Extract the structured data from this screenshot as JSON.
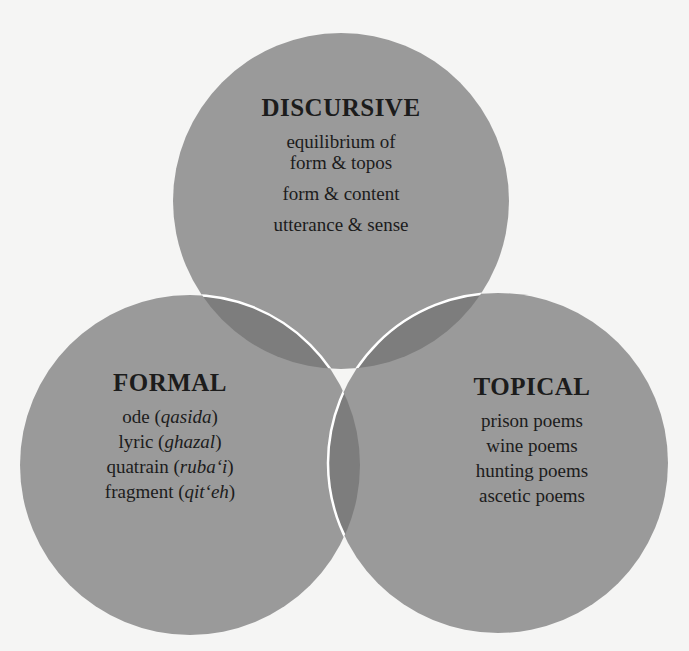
{
  "diagram": {
    "type": "venn-3",
    "colors": {
      "background": "#f5f5f4",
      "circle_fill": "#9a9a9a",
      "overlap_fill": "#7d7d7d",
      "center_fill": "#6f6f6f",
      "outline": "#ffffff",
      "text": "#1c1c1c"
    },
    "circles": [
      {
        "id": "discursive",
        "title": "DISCURSIVE",
        "items": [
          {
            "text": "equilibrium of",
            "lines": [
              "equilibrium of",
              "form & topos"
            ]
          },
          {
            "text": "form & content"
          },
          {
            "text": "utterance & sense"
          }
        ]
      },
      {
        "id": "formal",
        "title": "FORMAL",
        "items": [
          {
            "roman": "ode (",
            "italic": "qasida",
            "close": ")"
          },
          {
            "roman": "lyric (",
            "italic": "ghazal",
            "close": ")"
          },
          {
            "roman": "quatrain (",
            "italic": "ruba‘i",
            "close": ")"
          },
          {
            "roman": "fragment (",
            "italic": "qit‘eh",
            "close": ")"
          }
        ]
      },
      {
        "id": "topical",
        "title": "TOPICAL",
        "items": [
          {
            "text": "prison poems"
          },
          {
            "text": "wine poems"
          },
          {
            "text": "hunting poems"
          },
          {
            "text": "ascetic poems"
          }
        ]
      }
    ]
  }
}
